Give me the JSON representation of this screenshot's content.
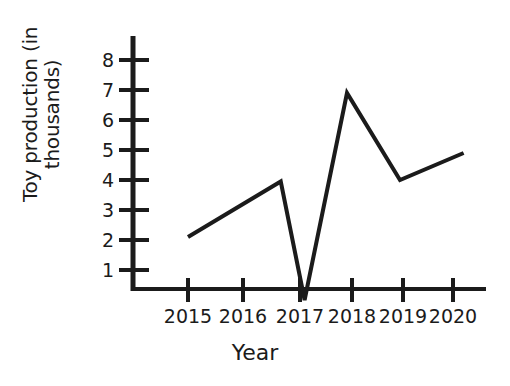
{
  "chart_data": {
    "type": "line",
    "title": "",
    "xlabel": "Year",
    "ylabel": "Toy production (in thousands)",
    "ylabel_lines": [
      "Toy production (in",
      "thousands)"
    ],
    "x_tick_labels": [
      "2015",
      "2016",
      "2017",
      "2018",
      "2019",
      "2020"
    ],
    "y_tick_labels": [
      "1",
      "2",
      "3",
      "4",
      "5",
      "6",
      "7",
      "8"
    ],
    "y_tick_values": [
      1,
      2,
      3,
      4,
      5,
      6,
      7,
      8
    ],
    "xlim": [
      2014.5,
      2020.6
    ],
    "ylim": [
      0,
      8.6
    ],
    "grid": false,
    "legend": false,
    "line_color": "#1b1b1b",
    "markers": false,
    "series": [
      {
        "name": "Toy production",
        "x": [
          2015.0,
          2016.75,
          2017.2,
          2018.0,
          2019.0,
          2020.2
        ],
        "values": [
          2.1,
          3.95,
          0.0,
          6.9,
          4.0,
          4.9
        ]
      }
    ]
  },
  "axes": {
    "axis_color": "#1b1b1b",
    "y_axis_label_text": "Toy production (in thousands)",
    "x_axis_label_text": "Year"
  }
}
